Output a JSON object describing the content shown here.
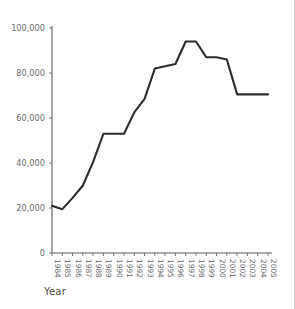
{
  "chart_data": {
    "type": "line",
    "title": "",
    "xlabel": "Year",
    "ylabel": "",
    "categories": [
      "1984",
      "1985",
      "1986",
      "1987",
      "1988",
      "1989",
      "1990",
      "1991",
      "1992",
      "1993",
      "1994",
      "1995",
      "1996",
      "1997",
      "1998",
      "1999",
      "2000",
      "2001",
      "2002",
      "2003",
      "2004",
      "2005"
    ],
    "values": [
      21000,
      19500,
      24500,
      30000,
      40500,
      53000,
      53000,
      53000,
      62500,
      68500,
      82000,
      83000,
      84000,
      94000,
      94000,
      87000,
      87000,
      86000,
      70500,
      70500,
      70500,
      70500
    ],
    "ylim": [
      0,
      100000
    ],
    "yticks": [
      0,
      20000,
      40000,
      60000,
      80000,
      100000
    ],
    "ytick_labels": [
      "0",
      "20,000",
      "40,000",
      "60,000",
      "80,000",
      "100,000"
    ],
    "grid": false,
    "legend": null,
    "series": [
      {
        "name": "",
        "values": [
          21000,
          19500,
          24500,
          30000,
          40500,
          53000,
          53000,
          53000,
          62500,
          68500,
          82000,
          83000,
          84000,
          94000,
          94000,
          87000,
          87000,
          86000,
          70500,
          70500,
          70500,
          70500
        ]
      }
    ],
    "line_color": "#2b2b2b",
    "axis_color": "#5a5a5a",
    "label_color": "#6b6b6b",
    "background_color": "#ffffff"
  },
  "axis": {
    "x_title": "Year"
  }
}
